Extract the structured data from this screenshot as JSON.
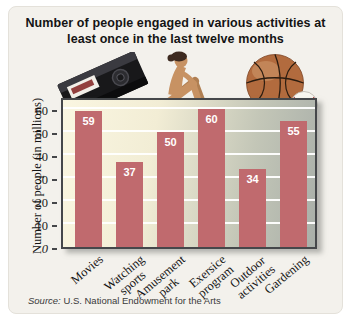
{
  "title": {
    "text": "Number of people engaged in various activities at\nleast once in the last twelve months"
  },
  "source": {
    "prefix": "Source:",
    "text": " U.S. National Endowment for the Arts"
  },
  "colors": {
    "bar": "#c06a6e",
    "bar_value_text": "#ffffff",
    "gridline": "#ffffff",
    "plot_bg_start": "#faf6e1",
    "plot_bg_end": "#a9afa9",
    "plot_border": "#45474a",
    "panel_bg": "#f3f1ec",
    "title_text": "#141414"
  },
  "chart_data": {
    "type": "bar",
    "title": "Number of people engaged in various activities at least once in the last twelve months",
    "categories": [
      "Movies",
      "Watching\nsports",
      "Amusement\npark",
      "Exersice\nprogram",
      "Outdoor\nactivities",
      "Gardening"
    ],
    "values": [
      59,
      37,
      50,
      60,
      34,
      55
    ],
    "xlabel": "",
    "ylabel": "Number of people (in millions)",
    "yticks": [
      0,
      10,
      20,
      30,
      40,
      50,
      60
    ],
    "ylim": [
      0,
      65
    ],
    "grid": "horizontal-white-lines",
    "legend": "none",
    "value_labels": "white, inside top of each bar",
    "source": "Source: U.S. National Endowment for the Arts"
  }
}
